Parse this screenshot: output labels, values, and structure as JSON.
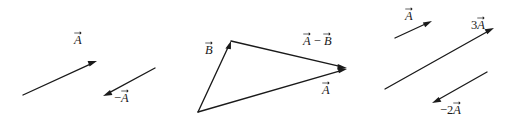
{
  "figure": {
    "background_color": "#ffffff",
    "ink_color": "#1a1a1a",
    "panels": [
      {
        "id": "panel-negation",
        "name": "vector-and-its-negative",
        "labels": [
          {
            "id": "label-a-left",
            "text": "A",
            "prefix": "",
            "coefficient": "",
            "has_overarrow": true,
            "x": 74,
            "y": 34
          },
          {
            "id": "label-minus-a",
            "text": "A",
            "prefix": "−",
            "coefficient": "",
            "has_overarrow": true,
            "x": 114,
            "y": 92
          }
        ],
        "arrows": [
          {
            "id": "arrow-a-left",
            "name": "vector-a-arrow",
            "from": [
              23,
              95
            ],
            "to": [
              97,
              61
            ],
            "direction": "up-right"
          },
          {
            "id": "arrow-minus-a",
            "name": "vector-minus-a-arrow",
            "from": [
              155,
              68
            ],
            "to": [
              103,
              96
            ],
            "direction": "down-left"
          }
        ]
      },
      {
        "id": "panel-subtraction",
        "name": "vector-subtraction-triangle",
        "labels": [
          {
            "id": "label-b",
            "text": "B",
            "prefix": "",
            "coefficient": "",
            "has_overarrow": true,
            "x": 205,
            "y": 44
          },
          {
            "id": "label-a-minus-b",
            "text": "A − B",
            "prefix": "",
            "coefficient": "",
            "has_overarrow": true,
            "x": 303,
            "y": 35
          },
          {
            "id": "label-a-middle",
            "text": "A",
            "prefix": "",
            "coefficient": "",
            "has_overarrow": true,
            "x": 322,
            "y": 84
          }
        ],
        "arrows": [
          {
            "id": "arrow-b",
            "name": "vector-b-arrow",
            "from": [
              198,
              112
            ],
            "to": [
              231,
              41
            ],
            "direction": "up-right"
          },
          {
            "id": "arrow-a-minus-b",
            "name": "vector-a-minus-b-arrow",
            "from": [
              231,
              41
            ],
            "to": [
              347,
              68
            ],
            "direction": "down-right"
          },
          {
            "id": "arrow-a-middle",
            "name": "vector-a-resultant-arrow",
            "from": [
              198,
              112
            ],
            "to": [
              347,
              69
            ],
            "direction": "up-right"
          }
        ]
      },
      {
        "id": "panel-scaling",
        "name": "scalar-multiples",
        "labels": [
          {
            "id": "label-a-right",
            "text": "A",
            "prefix": "",
            "coefficient": "",
            "has_overarrow": true,
            "x": 405,
            "y": 10
          },
          {
            "id": "label-3a",
            "text": "A",
            "prefix": "",
            "coefficient": "3",
            "has_overarrow": true,
            "x": 471,
            "y": 19
          },
          {
            "id": "label-minus-2a",
            "text": "A",
            "prefix": "−",
            "coefficient": "2",
            "has_overarrow": true,
            "x": 440,
            "y": 104
          }
        ],
        "arrows": [
          {
            "id": "arrow-a-right",
            "name": "vector-a-small-arrow",
            "from": [
              395,
              38
            ],
            "to": [
              432,
              21
            ],
            "direction": "up-right"
          },
          {
            "id": "arrow-3a",
            "name": "vector-3a-arrow",
            "from": [
              385,
              89
            ],
            "to": [
              494,
              28
            ],
            "direction": "up-right"
          },
          {
            "id": "arrow-minus-2a",
            "name": "vector-minus-2a-arrow",
            "from": [
              487,
              72
            ],
            "to": [
              432,
              103
            ],
            "direction": "down-left"
          }
        ]
      }
    ]
  }
}
